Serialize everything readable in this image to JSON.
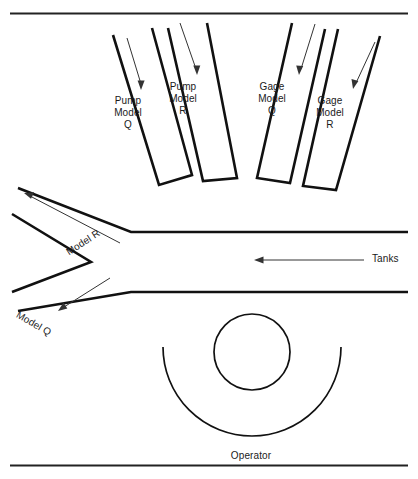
{
  "diagram": {
    "type": "floor-plan-schematic",
    "stroke_color": "#111111",
    "background_color": "#ffffff",
    "bays": [
      {
        "id": "pump-model-q",
        "label": "Pump\nModel\nQ",
        "product": "Pump",
        "model": "Q",
        "label_x": 128,
        "label_y": 95
      },
      {
        "id": "pump-model-r",
        "label": "Pump\nModel\nR",
        "product": "Pump",
        "model": "R",
        "label_x": 183,
        "label_y": 81
      },
      {
        "id": "gage-model-q",
        "label": "Gage\nModel\nQ",
        "product": "Gage",
        "model": "Q",
        "label_x": 272,
        "label_y": 81
      },
      {
        "id": "gage-model-r",
        "label": "Gage\nModel\nR",
        "product": "Gage",
        "model": "R",
        "label_x": 330,
        "label_y": 95
      }
    ],
    "aisle_labels": [
      {
        "id": "model-r",
        "label": "Model R",
        "x": 64,
        "y": 248,
        "rotation": -33
      },
      {
        "id": "model-q",
        "label": "Model Q",
        "x": 20,
        "y": 309,
        "rotation": 30
      }
    ],
    "annotations": [
      {
        "id": "tanks",
        "label": "Tanks",
        "x": 372,
        "y": 259
      },
      {
        "id": "operator",
        "label": "Operator",
        "x": 251,
        "y": 457
      }
    ]
  }
}
